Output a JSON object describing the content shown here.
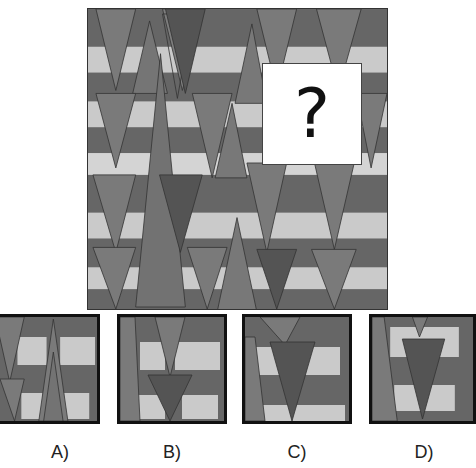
{
  "puzzle": {
    "type": "visual-pattern-completion",
    "missing_marker": "?",
    "colors": {
      "band_dark": "#666666",
      "band_light": "#cacaca",
      "triangle_mid": "#7a7a7a",
      "triangle_dark": "#545454",
      "outline": "#333333"
    }
  },
  "options": [
    {
      "id": "A",
      "label": "A)"
    },
    {
      "id": "B",
      "label": "B)"
    },
    {
      "id": "C",
      "label": "C)"
    },
    {
      "id": "D",
      "label": "D)"
    }
  ]
}
